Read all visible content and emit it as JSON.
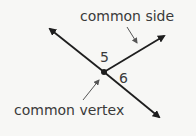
{
  "diagram": {
    "labels": {
      "common_side": "common side",
      "common_vertex": "common vertex",
      "angle_5": "5",
      "angle_6": "6"
    },
    "colors": {
      "line": "#1e1e1e",
      "text": "#3a3a3a",
      "pointer": "#555555",
      "background": "#f7f7f5"
    }
  }
}
